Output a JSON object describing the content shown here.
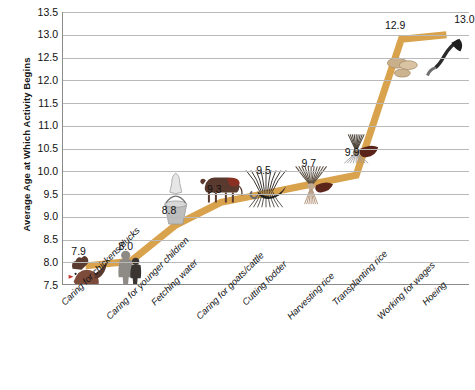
{
  "chart_data": {
    "type": "line",
    "title": "",
    "xlabel": "",
    "ylabel": "Average Age at Which Activity Begins",
    "ylim": [
      7.5,
      13.5
    ],
    "ytick_step": 0.5,
    "grid": true,
    "legend": "none",
    "line_color": "#D9A24C",
    "categories": [
      "Caring for chickens/ducks",
      "Caring for younger children",
      "Fetching water",
      "Caring for goats/cattle",
      "Cutting fodder",
      "Harvesting  rice",
      "Transplanting rice",
      "Working for wages",
      "Hoeing"
    ],
    "values": [
      7.9,
      8.0,
      8.8,
      9.3,
      9.5,
      9.7,
      9.9,
      12.9,
      13.0
    ],
    "data_labels": [
      "7.9",
      "8.0",
      "8.8",
      "9.3",
      "9.5",
      "9.7",
      "9.9",
      "12.9",
      "13.0"
    ],
    "point_icons": [
      "rooster-icon",
      "children-icon",
      "water-bucket-icon",
      "cow-icon",
      "fodder-sickle-icon",
      "rice-sheaf-icon",
      "rice-seedling-icon",
      "coins-icon",
      "hoe-icon"
    ],
    "ytick_labels": [
      "13.5",
      "13.0",
      "12.5",
      "12.0",
      "11.5",
      "11.0",
      "10.5",
      "10.0",
      "9.5",
      "9.0",
      "8.5",
      "8.0",
      "7.5"
    ]
  }
}
